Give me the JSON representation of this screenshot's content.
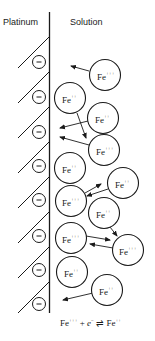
{
  "labels": {
    "left": "Platinum",
    "right": "Solution"
  },
  "electrode": {
    "charge_symbol": "−",
    "charge_count": 8
  },
  "ions": [
    {
      "species": "Fe",
      "charge": "+++",
      "x": 105,
      "y": 75
    },
    {
      "species": "Fe",
      "charge": "++",
      "x": 70,
      "y": 98
    },
    {
      "species": "Fe",
      "charge": "++",
      "x": 103,
      "y": 118
    },
    {
      "species": "Fe",
      "charge": "+++",
      "x": 104,
      "y": 150
    },
    {
      "species": "Fe",
      "charge": "++",
      "x": 70,
      "y": 168
    },
    {
      "species": "Fe",
      "charge": "++",
      "x": 123,
      "y": 183
    },
    {
      "species": "Fe",
      "charge": "+++",
      "x": 71,
      "y": 201
    },
    {
      "species": "Fe",
      "charge": "++",
      "x": 104,
      "y": 213
    },
    {
      "species": "Fe",
      "charge": "+++",
      "x": 71,
      "y": 238
    },
    {
      "species": "Fe",
      "charge": "+++",
      "x": 128,
      "y": 250
    },
    {
      "species": "Fe",
      "charge": "++",
      "x": 72,
      "y": 272
    },
    {
      "species": "Fe",
      "charge": "++",
      "x": 107,
      "y": 290
    }
  ],
  "equation": {
    "lhs_species": "Fe",
    "lhs_charge": "+++",
    "plus": " + ",
    "electron": "e",
    "electron_charge": "−",
    "arrow": " ⇌ ",
    "rhs_species": "Fe",
    "rhs_charge": "++"
  }
}
